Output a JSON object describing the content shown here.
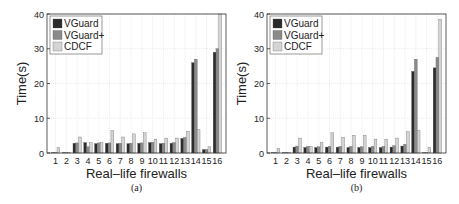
{
  "colors": {
    "VGuard": "#2b2b2b",
    "VGuard+": "#8a8a8a",
    "CDCF": "#d4d4d4",
    "grid": "#dddddd",
    "axis": "#333333"
  },
  "chart_data": [
    {
      "type": "bar",
      "caption": "(a)",
      "title": "",
      "xlabel": "Real–life firewalls",
      "ylabel": "Time(s)",
      "ylim": [
        0,
        40
      ],
      "yticks": [
        0,
        10,
        20,
        30,
        40
      ],
      "grid": true,
      "legend_position": "upper-left",
      "categories": [
        "1",
        "2",
        "3",
        "4",
        "5",
        "6",
        "7",
        "8",
        "9",
        "10",
        "11",
        "12",
        "13",
        "14",
        "15",
        "16"
      ],
      "series": [
        {
          "name": "VGuard",
          "values": [
            0.1,
            0.1,
            2.8,
            3.0,
            2.7,
            2.8,
            2.7,
            2.7,
            2.8,
            3.0,
            2.7,
            2.8,
            4.2,
            26.0,
            1.0,
            29.0
          ]
        },
        {
          "name": "VGuard+",
          "values": [
            0.1,
            0.1,
            2.9,
            1.8,
            2.9,
            2.9,
            2.8,
            2.8,
            2.9,
            3.1,
            2.8,
            3.0,
            4.5,
            27.0,
            1.0,
            30.0
          ]
        },
        {
          "name": "CDCF",
          "values": [
            1.5,
            0.1,
            4.6,
            3.0,
            3.0,
            6.5,
            4.6,
            5.5,
            5.8,
            4.0,
            4.3,
            4.3,
            6.3,
            6.7,
            1.8,
            40.0
          ]
        }
      ]
    },
    {
      "type": "bar",
      "caption": "(b)",
      "title": "",
      "xlabel": "Real–life firewalls",
      "ylabel": "Time(s)",
      "ylim": [
        0,
        40
      ],
      "yticks": [
        0,
        10,
        20,
        30,
        40
      ],
      "grid": true,
      "legend_position": "upper-left",
      "categories": [
        "1",
        "2",
        "3",
        "4",
        "5",
        "6",
        "7",
        "8",
        "9",
        "10",
        "11",
        "12",
        "13",
        "14",
        "15",
        "16"
      ],
      "series": [
        {
          "name": "VGuard",
          "values": [
            0.1,
            0.1,
            1.7,
            1.6,
            1.6,
            1.7,
            1.7,
            1.6,
            1.6,
            1.6,
            1.6,
            1.7,
            2.0,
            23.5,
            0.1,
            24.5
          ]
        },
        {
          "name": "VGuard+",
          "values": [
            0.1,
            0.1,
            2.0,
            1.9,
            1.8,
            1.9,
            1.9,
            1.9,
            1.8,
            1.9,
            1.9,
            2.1,
            2.5,
            27.0,
            0.1,
            27.5
          ]
        },
        {
          "name": "CDCF",
          "values": [
            1.3,
            0.2,
            4.3,
            1.9,
            3.0,
            5.8,
            4.5,
            5.1,
            5.1,
            4.0,
            4.0,
            4.3,
            6.1,
            6.5,
            1.7,
            38.5
          ]
        }
      ]
    }
  ]
}
